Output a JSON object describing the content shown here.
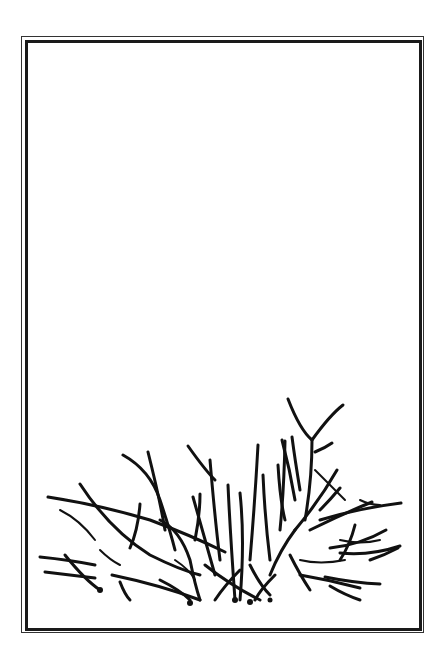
{
  "illustration": {
    "subject": "bare-shrub-drawing",
    "frame": {
      "style": "double-line-border",
      "color": "#1a1a1a"
    },
    "ink_color": "#111111",
    "background": "#ffffff"
  }
}
